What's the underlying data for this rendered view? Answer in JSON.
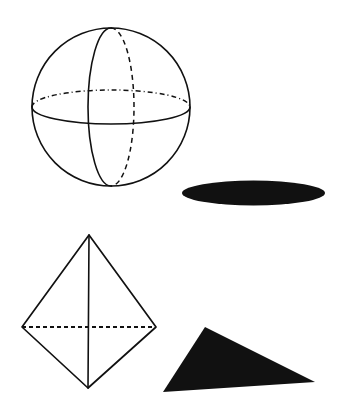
{
  "figure": {
    "title": "Geometric solids with their shadows",
    "background_color": "#ffffff",
    "ink_color": "#111111",
    "width": 339,
    "height": 419,
    "labels": {
      "sphere": "sphere",
      "sphere_shadow": "sphere shadow ellipse",
      "tetrahedron": "tetrahedron",
      "tetrahedron_shadow": "tetrahedron shadow triangle"
    },
    "shapes": [
      {
        "name": "sphere",
        "kind": "circle-with-great-circles",
        "outline_color": "#111111",
        "fill_color": "none",
        "stroke_width": 1.6,
        "center": {
          "x": 111,
          "y": 107
        },
        "radius": 79,
        "equator": {
          "rx": 79,
          "ry": 17,
          "visible_half": "bottom",
          "hidden_half": "top",
          "hidden_dash_pattern": "5 3 1 3"
        },
        "meridian": {
          "rx": 23,
          "ry": 79,
          "visible_half": "left",
          "hidden_half": "right",
          "hidden_dash_pattern": "5 4"
        }
      },
      {
        "name": "sphere-shadow",
        "kind": "ellipse",
        "fill_color": "#111111",
        "center": {
          "x": 253.5,
          "y": 193
        },
        "rx": 71.5,
        "ry": 12.5
      },
      {
        "name": "tetrahedron",
        "kind": "polyhedron-wireframe",
        "outline_color": "#111111",
        "fill_color": "none",
        "stroke_width": 1.6,
        "vertices": {
          "apex": {
            "x": 89,
            "y": 235
          },
          "left": {
            "x": 22,
            "y": 327
          },
          "right": {
            "x": 156,
            "y": 327
          },
          "bottom": {
            "x": 88,
            "y": 388
          }
        },
        "hidden_edge": {
          "from": "left",
          "to": "right",
          "dash_pattern": "4 3"
        },
        "visible_edges": [
          "apex-left",
          "apex-right",
          "apex-bottom",
          "left-bottom",
          "right-bottom"
        ]
      },
      {
        "name": "tetrahedron-shadow",
        "kind": "triangle",
        "fill_color": "#111111",
        "vertices": [
          {
            "x": 205,
            "y": 327
          },
          {
            "x": 315,
            "y": 382
          },
          {
            "x": 163,
            "y": 392
          }
        ]
      }
    ]
  }
}
